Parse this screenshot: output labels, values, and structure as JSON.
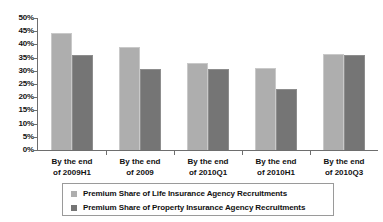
{
  "chart_data": {
    "type": "bar",
    "title": "",
    "xlabel": "",
    "ylabel": "",
    "ylim": [
      0,
      50
    ],
    "grid": false,
    "legend_position": "bottom",
    "categories": [
      "By the end of 2009H1",
      "By the end of 2009",
      "By the end of 2010Q1",
      "By the end of 2010H1",
      "By the end of 2010Q3"
    ],
    "category_lines": [
      [
        "By the end",
        "of 2009H1"
      ],
      [
        "By the end",
        "of 2009"
      ],
      [
        "By the end",
        "of 2010Q1"
      ],
      [
        "By the end",
        "of 2010H1"
      ],
      [
        "By the end",
        "of 2010Q3"
      ]
    ],
    "ytick_labels": [
      "50%",
      "45%",
      "40%",
      "35%",
      "30%",
      "25%",
      "20%",
      "15%",
      "10%",
      "5%",
      "0%"
    ],
    "ytick_values": [
      50,
      45,
      40,
      35,
      30,
      25,
      20,
      15,
      10,
      5,
      0
    ],
    "series": [
      {
        "name": "Premium Share of Life Insurance Agency Recruitments",
        "color": "#aeaeae",
        "values": [
          44.5,
          39.0,
          33.0,
          31.0,
          36.5
        ]
      },
      {
        "name": "Premium Share of Property Insurance Agency Recruitments",
        "color": "#757575",
        "values": [
          36.0,
          30.5,
          30.5,
          23.0,
          36.0
        ]
      }
    ]
  },
  "legend": {
    "entries": [
      "Premium Share of Life Insurance Agency Recruitments",
      "Premium Share of Property Insurance Agency Recruitments"
    ]
  }
}
